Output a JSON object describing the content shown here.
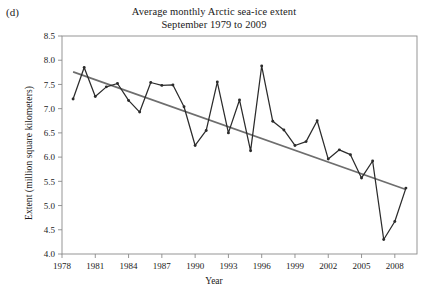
{
  "panel": {
    "label": "(d)"
  },
  "chart_data": {
    "type": "line",
    "title": "Average monthly Arctic sea-ice extent",
    "subtitle": "September 1979 to 2009",
    "xlabel": "Year",
    "ylabel": "Extent (million square kilometers)",
    "xlim": [
      1978,
      2010
    ],
    "ylim": [
      4.0,
      8.5
    ],
    "xticks": [
      1978,
      1981,
      1984,
      1987,
      1990,
      1993,
      1996,
      1999,
      2002,
      2005,
      2008
    ],
    "yticks": [
      "4.0",
      "4.5",
      "5.0",
      "5.5",
      "6.0",
      "6.5",
      "7.0",
      "7.5",
      "8.0",
      "8.5"
    ],
    "grid": false,
    "legend": "none",
    "series": [
      {
        "name": "September sea-ice extent",
        "type": "line-markers",
        "color": "#2b2b2b",
        "x": [
          1979,
          1980,
          1981,
          1982,
          1983,
          1984,
          1985,
          1986,
          1987,
          1988,
          1989,
          1990,
          1991,
          1992,
          1993,
          1994,
          1995,
          1996,
          1997,
          1998,
          1999,
          2000,
          2001,
          2002,
          2003,
          2004,
          2005,
          2006,
          2007,
          2008,
          2009
        ],
        "values": [
          7.2,
          7.85,
          7.25,
          7.45,
          7.52,
          7.17,
          6.93,
          7.54,
          7.48,
          7.49,
          7.04,
          6.24,
          6.55,
          7.55,
          6.5,
          7.18,
          6.13,
          7.88,
          6.74,
          6.56,
          6.24,
          6.32,
          6.75,
          5.96,
          6.15,
          6.05,
          5.57,
          5.92,
          4.3,
          4.67,
          5.36
        ]
      },
      {
        "name": "Linear trend",
        "type": "trend",
        "color": "#6e6e6e",
        "x": [
          1979,
          2009
        ],
        "values": [
          7.76,
          5.33
        ]
      }
    ]
  }
}
